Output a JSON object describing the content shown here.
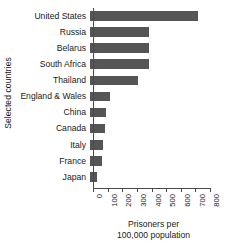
{
  "chart_data": {
    "type": "bar",
    "orientation": "horizontal",
    "title": "",
    "xlabel_line1": "Prisoners per",
    "xlabel_line2": "100,000 population",
    "ylabel": "Selected countries",
    "categories": [
      "United States",
      "Russia",
      "Belarus",
      "South Africa",
      "Thailand",
      "England & Wales",
      "China",
      "Canada",
      "Italy",
      "France",
      "Japan"
    ],
    "values": [
      740,
      405,
      405,
      400,
      330,
      140,
      110,
      100,
      90,
      85,
      45
    ],
    "xlim": [
      0,
      800
    ],
    "xticks": [
      0,
      100,
      200,
      300,
      400,
      500,
      600,
      700,
      800
    ],
    "xtick_labels": [
      "0",
      "100",
      "200",
      "300",
      "400",
      "500",
      "600",
      "700",
      "800"
    ],
    "grid": false,
    "legend": null,
    "bar_color": "#555555",
    "axis_color": "#4a4a4a",
    "background": "#ffffff"
  }
}
